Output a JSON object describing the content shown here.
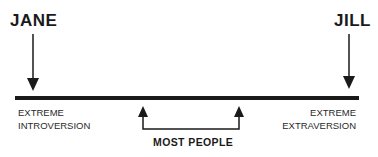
{
  "diagram": {
    "left_person": "JANE",
    "right_person": "JILL",
    "left_pole": [
      "EXTREME",
      "INTROVERSION"
    ],
    "right_pole": [
      "EXTREME",
      "EXTRAVERSION"
    ],
    "middle_label": "MOST PEOPLE",
    "colors": {
      "ink": "#1a1a1a",
      "background": "#ffffff"
    }
  }
}
